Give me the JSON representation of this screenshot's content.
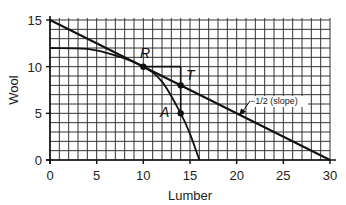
{
  "chart_data": {
    "type": "line",
    "title": "",
    "xlabel": "Lumber",
    "ylabel": "Wool",
    "xlim": [
      0,
      30
    ],
    "ylim": [
      0,
      15
    ],
    "x_ticks": [
      0,
      5,
      10,
      15,
      20,
      25,
      30
    ],
    "y_ticks": [
      0,
      5,
      10,
      15
    ],
    "grid": true,
    "grid_step": 1,
    "legend": null,
    "series": [
      {
        "name": "Trade line",
        "style": "straight",
        "points": [
          [
            0,
            15
          ],
          [
            30,
            0
          ]
        ],
        "slope": -0.5
      },
      {
        "name": "Production possibilities curve",
        "style": "concave",
        "points": [
          [
            0,
            12
          ],
          [
            4,
            11.9
          ],
          [
            7,
            11.2
          ],
          [
            10,
            10
          ],
          [
            12,
            8.4
          ],
          [
            14,
            5
          ],
          [
            15,
            2.8
          ],
          [
            16,
            0
          ]
        ]
      }
    ],
    "points": [
      {
        "label": "R",
        "x": 10,
        "y": 10
      },
      {
        "label": "T",
        "x": 14,
        "y": 8
      },
      {
        "label": "A",
        "x": 14,
        "y": 5
      }
    ],
    "guides": [
      {
        "from": [
          10,
          10
        ],
        "to": [
          14,
          10
        ]
      },
      {
        "from": [
          14,
          10
        ],
        "to": [
          14,
          5
        ]
      }
    ],
    "annotations": [
      {
        "text": "−1/2 (slope)",
        "arrow_to": [
          21,
          4.8
        ]
      }
    ]
  },
  "labels": {
    "xlabel": "Lumber",
    "ylabel": "Wool",
    "x_ticks": [
      "0",
      "5",
      "10",
      "15",
      "20",
      "25",
      "30"
    ],
    "y_ticks": [
      "0",
      "5",
      "10",
      "15"
    ],
    "point_R": "R",
    "point_T": "T",
    "point_A": "A",
    "slope_note": "−1/2 (slope)"
  }
}
